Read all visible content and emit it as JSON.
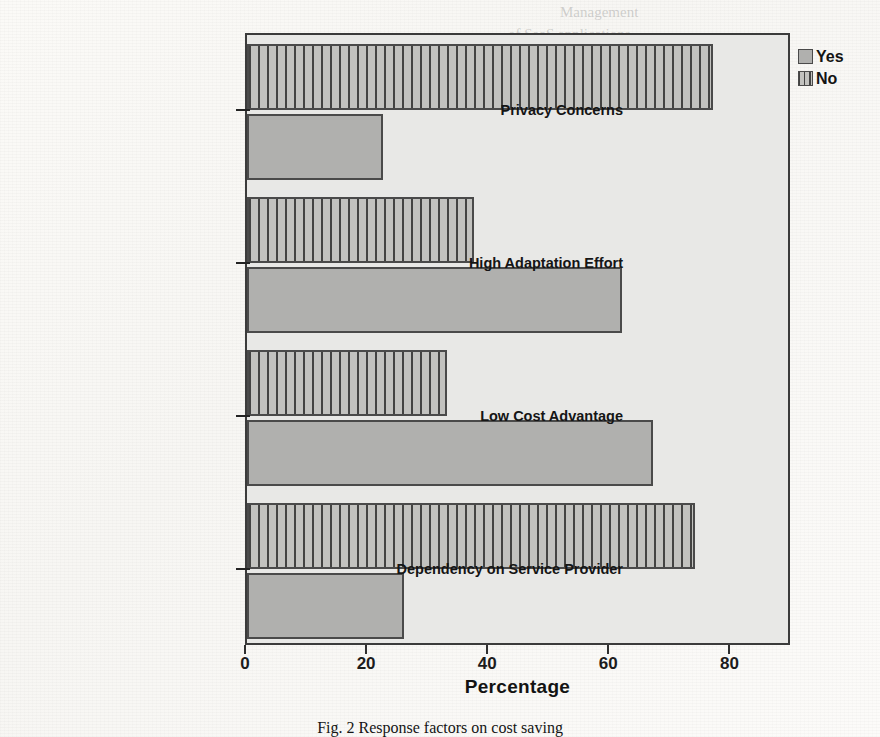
{
  "chart_data": {
    "type": "bar",
    "orientation": "horizontal",
    "title": "",
    "xlabel": "Percentage",
    "ylabel": "",
    "xlim": [
      0,
      90
    ],
    "xticks": [
      0,
      20,
      40,
      60,
      80
    ],
    "grid": false,
    "legend_position": "top-right",
    "categories": [
      "Privacy Concerns",
      "High Adaptation Effort",
      "Low Cost Advantage",
      "Dependency on Service Provider"
    ],
    "series": [
      {
        "name": "Yes",
        "values": [
          22.5,
          62,
          67,
          26
        ]
      },
      {
        "name": "No",
        "values": [
          77,
          37.5,
          33,
          74
        ]
      }
    ]
  },
  "legend": {
    "items": [
      {
        "label": "Yes",
        "style": "solid-gray",
        "color": "#b0b0ae"
      },
      {
        "label": "No",
        "style": "dotted-gray",
        "color": "#c2c2bf"
      }
    ]
  },
  "axis": {
    "x_title": "Percentage",
    "tick_labels": [
      "0",
      "20",
      "40",
      "60",
      "80"
    ]
  },
  "caption": {
    "text": "Fig. 2  Response factors on cost saving"
  },
  "page_bleed": {
    "lines": [
      "Management",
      "of SaaS applications",
      "Economic Cost",
      "Checking the suitability",
      "of the",
      "High availability",
      "Growth",
      "as Technology and Performance metrics",
      "Dependency on Service Provider",
      "Quality",
      "Agility"
    ]
  },
  "colors": {
    "plot_background": "#e8e8e6",
    "frame": "#3b3b3b",
    "bar_border": "#4a4a4a",
    "yes_fill": "#b0b0ae",
    "no_fill": "#c2c2bf"
  }
}
